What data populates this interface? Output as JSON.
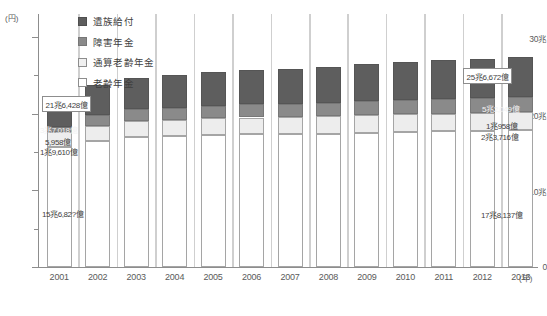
{
  "chart_data": {
    "type": "bar",
    "stacked": true,
    "title": "",
    "xlabel": "(年)",
    "ylabel": "(円)",
    "ylim": [
      0,
      33
    ],
    "yticks": [
      0,
      10,
      20,
      30
    ],
    "ytick_labels": [
      "0",
      "10兆",
      "20兆",
      "30兆"
    ],
    "y_unit_label": "(円)",
    "x_unit_label": "(年)",
    "grid": false,
    "legend_position": "top-left",
    "categories": [
      "2001",
      "2002",
      "2003",
      "2004",
      "2005",
      "2006",
      "2007",
      "2008",
      "2009",
      "2010",
      "2011",
      "2012",
      "2013"
    ],
    "series": [
      {
        "name": "老齢年金",
        "fill": "#ffffff",
        "values": [
          15.682,
          16.4,
          16.9,
          17.05,
          17.2,
          17.3,
          17.3,
          17.4,
          17.5,
          17.6,
          17.7,
          17.75,
          17.8137
        ]
      },
      {
        "name": "通算老齢年金",
        "fill": "#ededed",
        "values": [
          1.961,
          2.05,
          2.1,
          2.15,
          2.18,
          2.2,
          2.22,
          2.25,
          2.28,
          2.3,
          2.32,
          2.35,
          2.3716
        ]
      },
      {
        "name": "障害年金",
        "fill": "#8a8a8a",
        "values": [
          0.5958,
          1.4,
          1.55,
          1.6,
          1.65,
          1.7,
          1.75,
          1.8,
          1.85,
          1.88,
          1.9,
          1.93,
          1.958
        ]
      },
      {
        "name": "遺族給付",
        "fill": "#5e5e5e",
        "values": [
          3.7018,
          3.95,
          4.15,
          4.25,
          4.35,
          4.45,
          4.55,
          4.7,
          4.85,
          4.95,
          5.05,
          5.15,
          5.2049
        ]
      }
    ],
    "totals": [
      21.6428,
      23.8,
      24.7,
      25.05,
      25.38,
      25.65,
      25.82,
      26.15,
      26.48,
      26.75,
      26.97,
      27.18,
      25.6672
    ],
    "annotations": {
      "total_2001": "21兆6,428億",
      "total_2013": "25兆6,672億",
      "bar2001_izoku": "3兆7,018億",
      "bar2001_shougai": "5,958億",
      "bar2001_tsuusan": "1兆9,610億",
      "bar2001_rourei": "15兆6,82?億",
      "bar2013_izoku": "5兆2,049億",
      "bar2013_shougai": "1兆958億",
      "bar2013_tsuusan": "2兆3,716億",
      "bar2013_rourei": "17兆8,137億"
    }
  },
  "legend": {
    "items": [
      {
        "label": "遺族給付"
      },
      {
        "label": "障害年金"
      },
      {
        "label": "通算老齢年金"
      },
      {
        "label": "老齢年金"
      }
    ]
  }
}
